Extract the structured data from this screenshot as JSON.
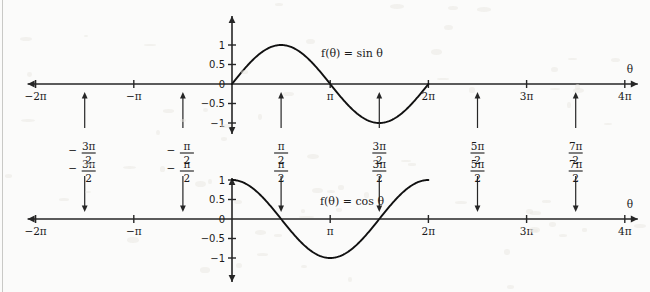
{
  "figure": {
    "background_color": "#fbfbfa",
    "ink_color": "#1a1a1a",
    "width": 650,
    "height": 292
  },
  "chart_data": [
    {
      "type": "line",
      "title": "",
      "function_label": "f(θ) = sin θ",
      "xlabel": "θ",
      "ylabel": "",
      "xlim": [
        -6.283185,
        12.566371
      ],
      "ylim": [
        -1.25,
        1.25
      ],
      "grid": false,
      "legend": "none",
      "x_tick_labels": [
        "−2π",
        "−π",
        "0",
        "π",
        "2π",
        "3π",
        "4π"
      ],
      "x_tick_values": [
        -6.283185,
        -3.141593,
        0,
        3.141593,
        6.283185,
        9.424778,
        12.566371
      ],
      "y_tick_labels": [
        "1",
        "0.5",
        "0",
        "−0.5",
        "−1"
      ],
      "y_tick_values": [
        1,
        0.5,
        0,
        -0.5,
        -1
      ],
      "drawn_domain": [
        0,
        6.283185
      ],
      "series": [
        {
          "name": "sin θ",
          "x": [
            0,
            0.3927,
            0.7854,
            1.1781,
            1.5708,
            1.9635,
            2.3562,
            2.7489,
            3.1416,
            3.5343,
            3.927,
            4.3197,
            4.7124,
            5.1051,
            5.4978,
            5.8905,
            6.2832
          ],
          "values": [
            0,
            0.3827,
            0.7071,
            0.9239,
            1,
            0.9239,
            0.7071,
            0.3827,
            0,
            -0.3827,
            -0.7071,
            -0.9239,
            -1,
            -0.9239,
            -0.7071,
            -0.3827,
            0
          ]
        }
      ],
      "pointer_annotations": [
        {
          "label_num": "3π",
          "label_den": "2",
          "sign": "−",
          "x_value": -4.712389,
          "direction": "up"
        },
        {
          "label_num": "π",
          "label_den": "2",
          "sign": "−",
          "x_value": -1.570796,
          "direction": "up"
        },
        {
          "label_num": "π",
          "label_den": "2",
          "sign": "",
          "x_value": 1.570796,
          "direction": "up"
        },
        {
          "label_num": "3π",
          "label_den": "2",
          "sign": "",
          "x_value": 4.712389,
          "direction": "up"
        },
        {
          "label_num": "5π",
          "label_den": "2",
          "sign": "",
          "x_value": 7.853982,
          "direction": "up"
        },
        {
          "label_num": "7π",
          "label_den": "2",
          "sign": "",
          "x_value": 10.995574,
          "direction": "up"
        }
      ]
    },
    {
      "type": "line",
      "title": "",
      "function_label": "f(θ) = cos θ",
      "xlabel": "θ",
      "ylabel": "",
      "xlim": [
        -6.283185,
        12.566371
      ],
      "ylim": [
        -1.25,
        1.25
      ],
      "grid": false,
      "legend": "none",
      "x_tick_labels": [
        "−2π",
        "−π",
        "0",
        "π",
        "2π",
        "3π",
        "4π"
      ],
      "x_tick_values": [
        -6.283185,
        -3.141593,
        0,
        3.141593,
        6.283185,
        9.424778,
        12.566371
      ],
      "y_tick_labels": [
        "1",
        "0.5",
        "0",
        "−0.5",
        "−1"
      ],
      "y_tick_values": [
        1,
        0.5,
        0,
        -0.5,
        -1
      ],
      "drawn_domain": [
        0,
        6.283185
      ],
      "series": [
        {
          "name": "cos θ",
          "x": [
            0,
            0.3927,
            0.7854,
            1.1781,
            1.5708,
            1.9635,
            2.3562,
            2.7489,
            3.1416,
            3.5343,
            3.927,
            4.3197,
            4.7124,
            5.1051,
            5.4978,
            5.8905,
            6.2832
          ],
          "values": [
            1,
            0.9239,
            0.7071,
            0.3827,
            0,
            -0.3827,
            -0.7071,
            -0.9239,
            -1,
            -0.9239,
            -0.7071,
            -0.3827,
            0,
            0.3827,
            0.7071,
            0.9239,
            1
          ]
        }
      ],
      "pointer_annotations": [
        {
          "label_num": "3π",
          "label_den": "2",
          "sign": "−",
          "x_value": -4.712389,
          "direction": "down"
        },
        {
          "label_num": "π",
          "label_den": "2",
          "sign": "−",
          "x_value": -1.570796,
          "direction": "down"
        },
        {
          "label_num": "π",
          "label_den": "2",
          "sign": "",
          "x_value": 1.570796,
          "direction": "down"
        },
        {
          "label_num": "3π",
          "label_den": "2",
          "sign": "",
          "x_value": 4.712389,
          "direction": "down"
        },
        {
          "label_num": "5π",
          "label_den": "2",
          "sign": "",
          "x_value": 7.853982,
          "direction": "down"
        },
        {
          "label_num": "7π",
          "label_den": "2",
          "sign": "",
          "x_value": 10.995574,
          "direction": "down"
        }
      ]
    }
  ]
}
